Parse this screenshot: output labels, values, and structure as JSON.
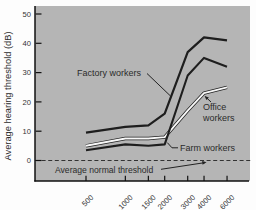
{
  "chart_data": {
    "type": "line",
    "xlabel": "",
    "ylabel": "Average hearing threshold (dB)",
    "x_scale": "log",
    "x_unit": "Hz",
    "categories": [
      500,
      1000,
      1500,
      2000,
      3000,
      4000,
      6000
    ],
    "x_tick_labels": [
      "500",
      "1000",
      "1500",
      "2000",
      "3000",
      "4000",
      "6000"
    ],
    "y_ticks": [
      0,
      10,
      20,
      30,
      40,
      50
    ],
    "y_tick_labels": [
      "0",
      "10",
      "20",
      "30",
      "40",
      "50"
    ],
    "ylim": [
      -7,
      52
    ],
    "grid": false,
    "legend": "direct-labels-on-chart",
    "series": [
      {
        "name": "Factory workers",
        "color": "#1e1e1e",
        "style": "solid",
        "values": [
          9.5,
          11.5,
          12,
          16,
          37,
          42,
          41
        ]
      },
      {
        "name": "Farm workers",
        "color": "#1e1e1e",
        "style": "solid",
        "values": [
          3.5,
          5.5,
          5,
          5.5,
          29,
          35,
          32
        ]
      },
      {
        "name": "Office workers",
        "color": "#f8f8f8",
        "style": "solid-white-with-dark-edge",
        "values": [
          5,
          7.5,
          7.5,
          8,
          17,
          23,
          25
        ]
      }
    ],
    "reference_line": {
      "label": "Average normal threshold",
      "value": 0,
      "style": "dashed"
    }
  },
  "labels": {
    "factory": "Factory workers",
    "office_line1": "Office",
    "office_line2": "workers",
    "farm": "Farm workers",
    "normal": "Average normal threshold"
  },
  "colors": {
    "plot_background": "#b5b5b5",
    "page_background": "#fdfdfd",
    "line_dark": "#1e1e1e",
    "line_white": "#f8f8f8",
    "dashed_line": "#333333",
    "text": "#2b2b2b"
  }
}
